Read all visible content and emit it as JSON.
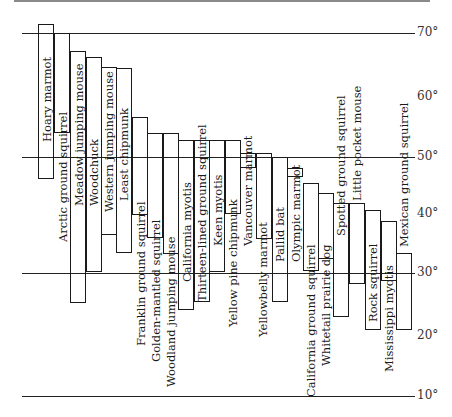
{
  "chart_data": {
    "type": "bar",
    "orientation": "floating-range (vertical)",
    "title": "",
    "xlabel": "",
    "ylabel": "Latitude",
    "ylim": [
      10,
      72
    ],
    "y_ticks": [
      "70°",
      "60°",
      "50°",
      "40°",
      "30°",
      "20°",
      "10°"
    ],
    "grid_lines_at": [
      70,
      50,
      30,
      10
    ],
    "legend": "none",
    "categories": [
      "Hoary marmot",
      "Arctic ground squirrel",
      "Meadow jumping mouse",
      "Woodchuck",
      "Western jumping mouse",
      "Least chipmunk",
      "Franklin ground squirrel",
      "Golden-mantled squirrel",
      "Woodland jumping mouse",
      "California myotis",
      "Thirteen-lined ground squirrel",
      "Keen myotis",
      "Yellow pine chipmunk",
      "Vancouver marmot",
      "Yellowbelly marmot",
      "Pallid bat",
      "Olympic marmot",
      "California ground squirrel",
      "Whitetail prairie dog",
      "Spotted ground squirrel",
      "Little pocket mouse",
      "Rock squirrel",
      "Mississippi myotis",
      "Mexican ground squirrel"
    ],
    "series": [
      {
        "name": "northern limit (°N)",
        "values": [
          71.5,
          70,
          67,
          66,
          64.5,
          64,
          56,
          54,
          54,
          53,
          53,
          53,
          53,
          51,
          51,
          50,
          48,
          46,
          44,
          42,
          42,
          41,
          39.5,
          33.5
        ]
      },
      {
        "name": "southern limit (°N)",
        "values": [
          47,
          54,
          25,
          30,
          36.5,
          33.5,
          40,
          36,
          33.5,
          24,
          25.5,
          30,
          40,
          48,
          36,
          25.5,
          46.5,
          30.5,
          32.5,
          23,
          28.5,
          21,
          28.5,
          21
        ]
      }
    ]
  },
  "axis": {
    "ticks": [
      {
        "label": "70°",
        "y": 33
      },
      {
        "label": "60°",
        "y": 97
      },
      {
        "label": "50°",
        "y": 157
      },
      {
        "label": "40°",
        "y": 214
      },
      {
        "label": "30°",
        "y": 273
      },
      {
        "label": "20°",
        "y": 336
      },
      {
        "label": "10°",
        "y": 396
      }
    ],
    "lines": [
      {
        "y": 33,
        "x1": 22,
        "x2": 415
      },
      {
        "y": 157,
        "x1": 22,
        "x2": 415
      },
      {
        "y": 273,
        "x1": 22,
        "x2": 415
      },
      {
        "y": 396,
        "x1": 22,
        "x2": 415
      }
    ]
  },
  "bars": [
    {
      "label": "Hoary marmot",
      "x": 38,
      "top": 24,
      "bottom": 179,
      "lx": 39,
      "ly": 142
    },
    {
      "label": "Arctic ground squirrel",
      "x": 54,
      "top": 33,
      "bottom": 133,
      "lx": 55,
      "ly": 242
    },
    {
      "label": "Meadow jumping mouse",
      "x": 70,
      "top": 51,
      "bottom": 303,
      "lx": 71,
      "ly": 206
    },
    {
      "label": "Woodchuck",
      "x": 86,
      "top": 57,
      "bottom": 272,
      "lx": 86,
      "ly": 206
    },
    {
      "label": "Western jumping mouse",
      "x": 101,
      "top": 67,
      "bottom": 235,
      "lx": 101,
      "ly": 212
    },
    {
      "label": "Least chipmunk",
      "x": 116,
      "top": 68,
      "bottom": 253,
      "lx": 116,
      "ly": 201
    },
    {
      "label": "Franklin ground squirrel",
      "x": 132,
      "top": 117,
      "bottom": 215,
      "lx": 133,
      "ly": 346
    },
    {
      "label": "Golden-mantled squirrel",
      "x": 147,
      "top": 133,
      "bottom": 238,
      "lx": 148,
      "ly": 362
    },
    {
      "label": "Woodland jumping mouse",
      "x": 163,
      "top": 133,
      "bottom": 254,
      "lx": 163,
      "ly": 387
    },
    {
      "label": "California myotis",
      "x": 178,
      "top": 140,
      "bottom": 310,
      "lx": 179,
      "ly": 282
    },
    {
      "label": "Thirteen-lined ground squirrel",
      "x": 194,
      "top": 140,
      "bottom": 302,
      "lx": 194,
      "ly": 302
    },
    {
      "label": "Keen myotis",
      "x": 209,
      "top": 140,
      "bottom": 272,
      "lx": 210,
      "ly": 246
    },
    {
      "label": "Yellow pine chipmunk",
      "x": 225,
      "top": 140,
      "bottom": 214,
      "lx": 225,
      "ly": 327
    },
    {
      "label": "Vancouver marmot",
      "x": 240,
      "top": 153,
      "bottom": 168,
      "lx": 240,
      "ly": 246
    },
    {
      "label": "Yellowbelly marmot",
      "x": 256,
      "top": 153,
      "bottom": 239,
      "lx": 255,
      "ly": 337
    },
    {
      "label": "Pallid bat",
      "x": 272,
      "top": 157,
      "bottom": 302,
      "lx": 272,
      "ly": 262
    },
    {
      "label": "Olympic marmot",
      "x": 287,
      "top": 168,
      "bottom": 177,
      "lx": 288,
      "ly": 262
    },
    {
      "label": "California ground squirrel",
      "x": 303,
      "top": 183,
      "bottom": 271,
      "lx": 303,
      "ly": 397
    },
    {
      "label": "Whitetail prairie dog",
      "x": 318,
      "top": 193,
      "bottom": 259,
      "lx": 318,
      "ly": 366
    },
    {
      "label": "Spotted ground squirrel",
      "x": 333,
      "top": 203,
      "bottom": 317,
      "lx": 333,
      "ly": 236
    },
    {
      "label": "Little pocket mouse",
      "x": 349,
      "top": 203,
      "bottom": 284,
      "lx": 349,
      "ly": 201
    },
    {
      "label": "Rock squirrel",
      "x": 365,
      "top": 210,
      "bottom": 330,
      "lx": 365,
      "ly": 322
    },
    {
      "label": "Mississippi myotis",
      "x": 381,
      "top": 221,
      "bottom": 281,
      "lx": 381,
      "ly": 372
    },
    {
      "label": "Mexican ground squirrel",
      "x": 396,
      "top": 253,
      "bottom": 330,
      "lx": 396,
      "ly": 247
    }
  ],
  "bar_width": 16
}
